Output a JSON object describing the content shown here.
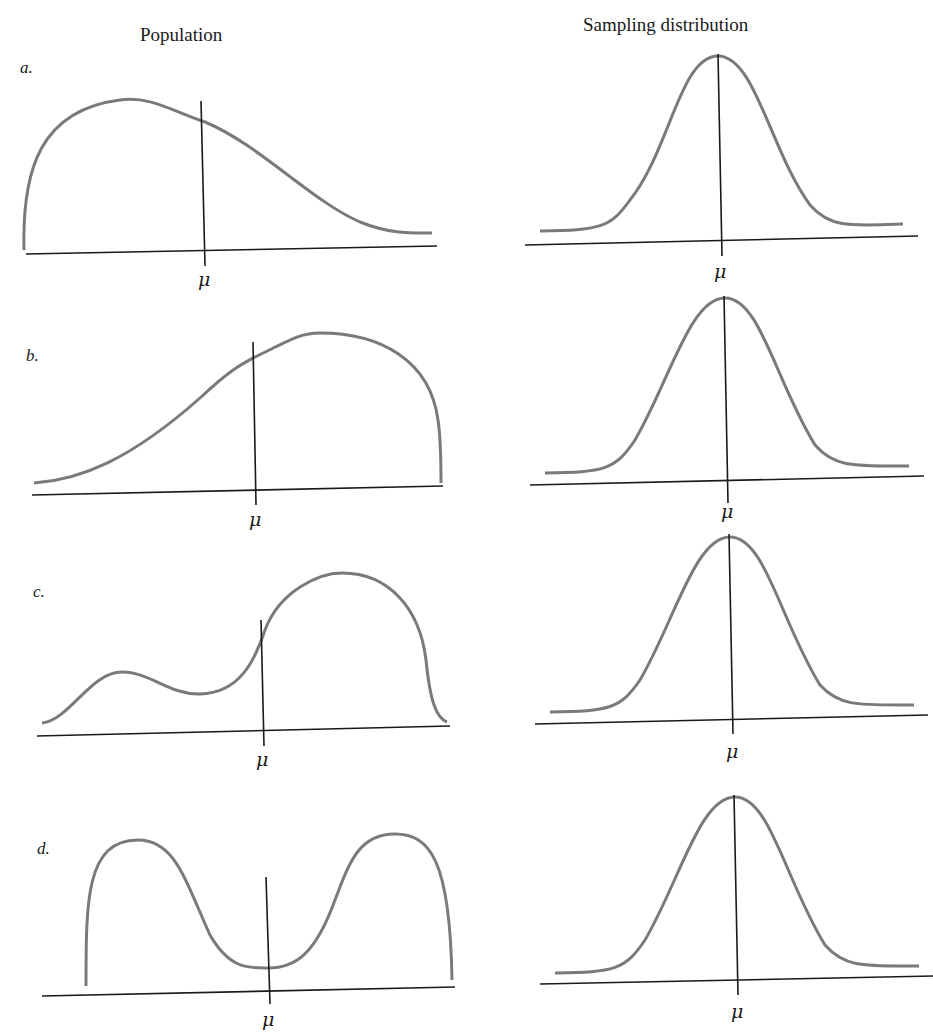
{
  "figure": {
    "columns": {
      "left_title": "Population",
      "right_title": "Sampling distribution"
    },
    "rows": [
      {
        "label": "a.",
        "population_shape": "right-skewed",
        "mean_symbol": "μ",
        "sampling_mean_symbol": "μ"
      },
      {
        "label": "b.",
        "population_shape": "left-skewed",
        "mean_symbol": "μ",
        "sampling_mean_symbol": "μ"
      },
      {
        "label": "c.",
        "population_shape": "bimodal, left-skewed",
        "mean_symbol": "μ",
        "sampling_mean_symbol": "μ"
      },
      {
        "label": "d.",
        "population_shape": "symmetric bimodal (U-shaped)",
        "mean_symbol": "μ",
        "sampling_mean_symbol": "μ"
      }
    ],
    "colors": {
      "curve": "#7a7a7a",
      "axis": "#1a1a1a",
      "background": "#ffffff"
    }
  }
}
